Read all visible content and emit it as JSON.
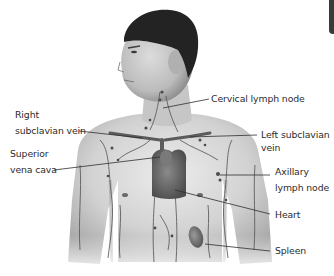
{
  "figure": {
    "colors": {
      "background": "#ffffff",
      "skin_light": "#e2e2e2",
      "skin_mid": "#bdbdbd",
      "skin_dark": "#8c8c8c",
      "hair": "#232323",
      "vessel": "#5a5a5a",
      "heart": "#6e6e6e",
      "leader_line": "#2f2f2f",
      "label_text": "#2b2b2b",
      "corner_tab": "#3a3a3a"
    }
  },
  "labels": {
    "cervical": {
      "lines": [
        "Cervical lymph node"
      ]
    },
    "right_subclavian": {
      "lines": [
        "Right",
        "subclavian vein"
      ]
    },
    "left_subclavian": {
      "lines": [
        "Left subclavian",
        "vein"
      ]
    },
    "superior_vena_cava": {
      "lines": [
        "Superior",
        "vena cava"
      ]
    },
    "axillary": {
      "lines": [
        "Axillary",
        "lymph node"
      ]
    },
    "heart": {
      "lines": [
        "Heart"
      ]
    },
    "spleen": {
      "lines": [
        "Spleen"
      ]
    }
  }
}
